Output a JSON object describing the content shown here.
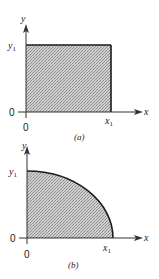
{
  "figure_a": {
    "caption": "(a)",
    "x_axis_label": "x",
    "y_axis_label": "y",
    "x_mark": "x",
    "x_mark_sub": "1",
    "y_mark": "y",
    "y_mark_sub": "1",
    "origin_left": "0",
    "origin_below": "0",
    "shape": "rectangle"
  },
  "figure_b": {
    "caption": "(b)",
    "x_axis_label": "x",
    "y_axis_label": "y",
    "x_mark": "x",
    "x_mark_sub": "1",
    "y_mark": "y",
    "y_mark_sub": "1",
    "origin_left": "0",
    "origin_below": "0",
    "shape": "quarter-ellipse"
  },
  "colors": {
    "fill": "#b8b8b8",
    "stroke": "#1a1a1a"
  }
}
